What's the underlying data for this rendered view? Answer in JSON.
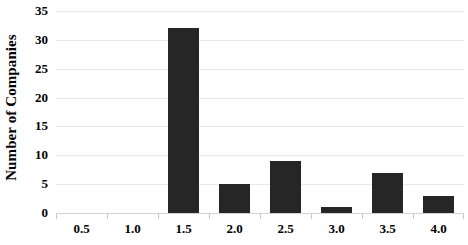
{
  "chart_data": {
    "type": "bar",
    "title": "",
    "subtitle": "",
    "xlabel": "",
    "ylabel": "Number of Companies",
    "categories": [
      "0.5",
      "1.0",
      "1.5",
      "2.0",
      "2.5",
      "3.0",
      "3.5",
      "4.0"
    ],
    "values": [
      0,
      0,
      32,
      5,
      9,
      1,
      7,
      3
    ],
    "ylim": [
      0,
      35
    ],
    "ytick_labels": [
      "0",
      "5",
      "10",
      "15",
      "20",
      "25",
      "30",
      "35"
    ],
    "ytick_values": [
      0,
      5,
      10,
      15,
      20,
      25,
      30,
      35
    ],
    "grid": true,
    "grid_axis": "y",
    "legend": false,
    "legend_position": "none",
    "bar_color": "#262626",
    "grid_color": "#e8e8e8",
    "axis_color": "#d2d2d2",
    "background_color": "#ffffff",
    "text_color": "#000000"
  }
}
